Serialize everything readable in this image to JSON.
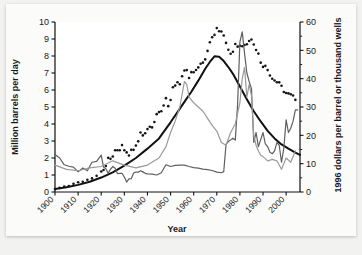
{
  "figure": {
    "background_color": "#f2f2f0",
    "paper_color": "#fbfbfa"
  },
  "chart_data": {
    "type": "line",
    "title": "",
    "subtitle": "",
    "xlabel": "Year",
    "ylabel": "Million barrels per day",
    "y2label": "1996 dollars per barrel or thousand wells",
    "xlim": [
      1900,
      2006
    ],
    "ylim": [
      0,
      10
    ],
    "y2lim": [
      0,
      60
    ],
    "grid": false,
    "legend": "none",
    "xticks": [
      1900,
      1910,
      1920,
      1930,
      1940,
      1950,
      1960,
      1970,
      1980,
      1990,
      2000
    ],
    "xticklabels": [
      "1900",
      "1910",
      "1920",
      "1930",
      "1940",
      "1950",
      "1960",
      "1970",
      "1980",
      "1990",
      "2000"
    ],
    "yticks": [
      0,
      1,
      2,
      3,
      4,
      5,
      6,
      7,
      8,
      9,
      10
    ],
    "yticklabels": [
      "0",
      "1",
      "2",
      "3",
      "4",
      "5",
      "6",
      "7",
      "8",
      "9",
      "10"
    ],
    "y2ticks": [
      0,
      10,
      20,
      30,
      40,
      50,
      60
    ],
    "y2ticklabels": [
      "0",
      "10",
      "20",
      "30",
      "40",
      "50",
      "60"
    ],
    "y2minorticks": [
      5,
      15,
      25,
      35,
      45,
      55
    ],
    "series": [
      {
        "name": "Hubbert curve (fitted)",
        "axis": "left",
        "style": "solid",
        "color": "#111111",
        "width": 2.0,
        "x": [
          1900,
          1905,
          1910,
          1915,
          1920,
          1925,
          1930,
          1935,
          1940,
          1945,
          1950,
          1953,
          1956,
          1959,
          1962,
          1965,
          1967,
          1969,
          1971,
          1973,
          1975,
          1977,
          1980,
          1983,
          1986,
          1989,
          1992,
          1995,
          1998,
          2001,
          2004,
          2006
        ],
        "values": [
          0.18,
          0.28,
          0.42,
          0.6,
          0.85,
          1.15,
          1.55,
          2.0,
          2.55,
          3.15,
          4.1,
          4.7,
          5.3,
          5.9,
          6.55,
          7.25,
          7.65,
          7.98,
          7.95,
          7.7,
          7.35,
          6.95,
          6.2,
          5.45,
          4.75,
          4.15,
          3.6,
          3.15,
          2.8,
          2.55,
          2.32,
          2.18
        ]
      },
      {
        "name": "Actual US crude oil production",
        "axis": "left",
        "style": "dotted",
        "color": "#151515",
        "width": 2.6,
        "x": [
          1900,
          1902,
          1904,
          1906,
          1908,
          1910,
          1912,
          1914,
          1916,
          1918,
          1920,
          1921,
          1922,
          1923,
          1924,
          1925,
          1926,
          1927,
          1928,
          1929,
          1930,
          1931,
          1932,
          1933,
          1934,
          1935,
          1936,
          1937,
          1938,
          1939,
          1940,
          1941,
          1942,
          1943,
          1944,
          1945,
          1946,
          1947,
          1948,
          1949,
          1950,
          1951,
          1952,
          1953,
          1954,
          1955,
          1956,
          1957,
          1958,
          1959,
          1960,
          1961,
          1962,
          1963,
          1964,
          1965,
          1966,
          1967,
          1968,
          1969,
          1970,
          1971,
          1972,
          1973,
          1974,
          1975,
          1976,
          1977,
          1978,
          1979,
          1980,
          1981,
          1982,
          1983,
          1984,
          1985,
          1986,
          1987,
          1988,
          1989,
          1990,
          1991,
          1992,
          1993,
          1994,
          1995,
          1996,
          1997,
          1998,
          1999,
          2000,
          2001,
          2002,
          2003,
          2004
        ],
        "values": [
          0.17,
          0.24,
          0.32,
          0.35,
          0.48,
          0.57,
          0.6,
          0.72,
          0.8,
          0.95,
          1.21,
          1.29,
          1.53,
          2.01,
          1.95,
          2.09,
          2.46,
          2.46,
          2.46,
          2.76,
          2.46,
          2.33,
          2.15,
          2.48,
          2.48,
          2.73,
          2.98,
          3.5,
          3.33,
          3.46,
          3.7,
          3.84,
          3.8,
          4.12,
          4.58,
          4.7,
          4.75,
          5.09,
          5.52,
          5.05,
          5.41,
          6.16,
          6.26,
          6.46,
          6.34,
          6.81,
          7.15,
          7.17,
          6.71,
          7.05,
          7.04,
          7.18,
          7.33,
          7.54,
          7.61,
          7.8,
          8.3,
          8.81,
          9.1,
          9.24,
          9.64,
          9.46,
          9.44,
          9.21,
          8.77,
          8.37,
          8.13,
          8.25,
          8.71,
          8.55,
          8.6,
          8.57,
          8.65,
          8.69,
          8.88,
          8.97,
          8.68,
          8.35,
          8.14,
          7.61,
          7.36,
          7.42,
          7.17,
          6.85,
          6.66,
          6.56,
          6.46,
          6.45,
          6.25,
          5.88,
          5.82,
          5.8,
          5.75,
          5.68,
          5.42
        ]
      },
      {
        "name": "Crude oil price (1996 dollars per barrel)",
        "axis": "right",
        "style": "solid",
        "color": "#5f5f5f",
        "width": 1.2,
        "x": [
          1900,
          1902,
          1904,
          1906,
          1908,
          1910,
          1912,
          1914,
          1916,
          1918,
          1920,
          1921,
          1922,
          1923,
          1924,
          1925,
          1926,
          1927,
          1928,
          1929,
          1930,
          1931,
          1932,
          1933,
          1934,
          1935,
          1936,
          1937,
          1938,
          1939,
          1940,
          1942,
          1944,
          1946,
          1948,
          1950,
          1952,
          1954,
          1956,
          1958,
          1960,
          1962,
          1964,
          1966,
          1968,
          1970,
          1972,
          1973,
          1974,
          1975,
          1976,
          1977,
          1978,
          1979,
          1980,
          1981,
          1982,
          1983,
          1984,
          1985,
          1986,
          1987,
          1988,
          1989,
          1990,
          1991,
          1992,
          1993,
          1994,
          1995,
          1996,
          1997,
          1998,
          1999,
          2000,
          2001,
          2002,
          2003,
          2004,
          2005
        ],
        "values": [
          13.2,
          12.0,
          9.6,
          9.1,
          8.8,
          7.1,
          8.5,
          7.5,
          10.5,
          10.8,
          13.0,
          8.8,
          8.2,
          6.6,
          8.0,
          9.0,
          8.4,
          6.5,
          6.6,
          6.6,
          5.3,
          3.5,
          4.6,
          4.7,
          6.7,
          7.0,
          7.0,
          7.5,
          7.1,
          6.6,
          6.4,
          6.3,
          6.0,
          6.8,
          9.6,
          9.0,
          9.4,
          9.5,
          9.5,
          9.0,
          8.6,
          8.4,
          8.1,
          7.9,
          7.6,
          7.0,
          6.8,
          7.2,
          16.8,
          17.8,
          18.4,
          19.0,
          18.3,
          31.0,
          53.0,
          56.5,
          49.0,
          42.0,
          39.0,
          36.5,
          17.5,
          21.0,
          16.0,
          18.5,
          21.0,
          17.0,
          16.0,
          14.0,
          13.5,
          14.5,
          17.5,
          16.5,
          10.5,
          15.5,
          25.5,
          21.0,
          22.5,
          25.0,
          29.0,
          29.0
        ]
      },
      {
        "name": "Oil wells drilled (thousand wells)",
        "axis": "right",
        "style": "solid",
        "color": "#9a9a9a",
        "width": 1.2,
        "x": [
          1900,
          1905,
          1910,
          1915,
          1920,
          1925,
          1930,
          1935,
          1940,
          1945,
          1948,
          1950,
          1952,
          1954,
          1956,
          1957,
          1958,
          1960,
          1962,
          1964,
          1966,
          1968,
          1970,
          1972,
          1974,
          1976,
          1978,
          1980,
          1981,
          1982,
          1983,
          1984,
          1985,
          1986,
          1987,
          1988,
          1989,
          1990,
          1992,
          1994,
          1996,
          1998,
          2000,
          2002,
          2004
        ],
        "values": [
          9.5,
          8.0,
          7.5,
          8.5,
          9.0,
          11.0,
          9.5,
          8.5,
          9.5,
          12.0,
          16.0,
          21.0,
          25.0,
          30.0,
          39.0,
          38.0,
          33.5,
          31.5,
          30.0,
          28.5,
          26.0,
          23.5,
          21.5,
          17.5,
          16.5,
          21.0,
          24.0,
          31.5,
          40.0,
          44.0,
          33.5,
          38.0,
          34.0,
          20.0,
          16.5,
          14.5,
          13.0,
          12.5,
          11.0,
          11.5,
          11.0,
          8.0,
          12.0,
          10.5,
          14.5
        ]
      }
    ]
  }
}
